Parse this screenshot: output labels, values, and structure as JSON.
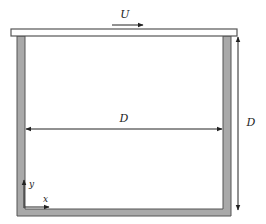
{
  "diagram": {
    "labels": {
      "velocity": "U",
      "width": "D",
      "height": "D",
      "x_axis": "x",
      "y_axis": "y"
    },
    "colors": {
      "wall_fill": "#a9a9a9",
      "wall_stroke": "#555555",
      "lid_fill": "#ffffff",
      "lid_stroke": "#555555",
      "arrow": "#222222"
    }
  }
}
